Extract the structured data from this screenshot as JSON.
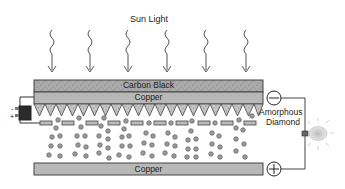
{
  "title": "Sun Light",
  "layers": {
    "carbon_black": "Carbon Black",
    "top_copper": "Copper",
    "diamond": "Amorphous Diamond",
    "diamond_line1": "Amorphous",
    "diamond_line2": "Diamond",
    "bottom_copper": "Copper"
  },
  "terminals": {
    "negative": "−",
    "positive": "+"
  },
  "battery": {
    "minus": "-",
    "plus": "+"
  },
  "colors": {
    "band_fill": "#b8b8b8",
    "carbon_fill": "#a8a8a8",
    "stroke": "#444444",
    "electron_fill": "#9a9a9a",
    "battery_fill": "#2a2a2a"
  },
  "arrow_count": 6,
  "triangle_count": 21
}
